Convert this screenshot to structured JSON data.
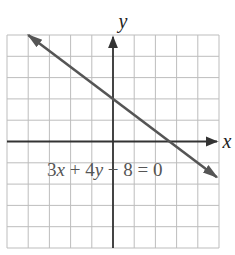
{
  "chart_data": {
    "type": "line",
    "title": "",
    "xlabel": "x",
    "ylabel": "y",
    "xlim": [
      -5,
      5
    ],
    "ylim": [
      -5,
      5
    ],
    "grid": true,
    "grid_step": 1,
    "series": [
      {
        "name": "3x + 4y − 8 = 0",
        "equation": "3x + 4y − 8 = 0",
        "x": [
          -4,
          4.9
        ],
        "y": [
          5,
          -1.675
        ],
        "y_intercept": 2,
        "x_intercept": 2.667,
        "color": "#555555"
      }
    ],
    "annotations": [
      {
        "text": "3x + 4y − 8 = 0",
        "x": -3.3,
        "y": -0.8
      }
    ]
  },
  "labels": {
    "x_axis": "x",
    "y_axis": "y",
    "equation_parts": [
      "3",
      "x",
      " + 4",
      "y",
      " − 8 = 0"
    ]
  },
  "colors": {
    "grid": "#bdbdbd",
    "axis": "#333333",
    "line": "#555555",
    "text": "#555555"
  }
}
